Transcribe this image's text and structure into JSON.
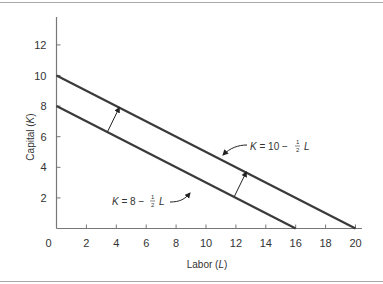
{
  "chart_data": {
    "type": "line",
    "title": "",
    "xlabel": "Labor (L)",
    "ylabel": "Capital (K)",
    "xlim": [
      0,
      20
    ],
    "ylim": [
      0,
      13
    ],
    "x_ticks": [
      0,
      2,
      4,
      6,
      8,
      10,
      12,
      14,
      16,
      18,
      20
    ],
    "y_ticks": [
      2,
      4,
      6,
      8,
      10,
      12
    ],
    "x_tick_labels": [
      "0",
      "2",
      "4",
      "6",
      "8",
      "10",
      "12",
      "14",
      "16",
      "18",
      "20"
    ],
    "y_tick_labels": [
      "2",
      "4",
      "6",
      "8",
      "10",
      "12"
    ],
    "grid": false,
    "series": [
      {
        "name": "K = 8 − ½ L",
        "x": [
          0,
          16
        ],
        "y": [
          8,
          0
        ]
      },
      {
        "name": "K = 10 − ½ L",
        "x": [
          0,
          20
        ],
        "y": [
          10,
          0
        ]
      }
    ],
    "annotations": [
      {
        "text": "K = 10 − ½ L",
        "points_to": "upper line near L=11"
      },
      {
        "text": "K = 8 − ½ L",
        "points_to": "lower line near L=11"
      },
      {
        "type": "arrow",
        "from": [
          3.4,
          6.3
        ],
        "to": [
          4.2,
          7.9
        ],
        "meaning": "shift outward"
      },
      {
        "type": "arrow",
        "from": [
          11.9,
          2.1
        ],
        "to": [
          12.7,
          3.7
        ],
        "meaning": "shift outward"
      }
    ]
  },
  "labels": {
    "x_axis": "Labor (L)",
    "x_axis_main": "Labor (",
    "x_axis_var": "L",
    "x_axis_close": ")",
    "y_axis_main": "Capital (",
    "y_axis_var": "K",
    "y_axis_close": ")",
    "eq_upper_k": "K",
    "eq_upper_mid": " = 10 − ",
    "eq_upper_l": "L",
    "eq_lower_k": "K",
    "eq_lower_mid": " = 8 − ",
    "eq_lower_l": "L",
    "frac_num": "1",
    "frac_den": "2"
  }
}
